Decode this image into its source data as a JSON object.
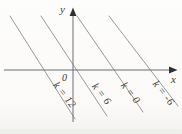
{
  "figure": {
    "width": 182,
    "height": 134,
    "colors": {
      "level_line": "#9a9a9a",
      "axis": "#6e6e6e",
      "arrow_fill": "#2f2f2f",
      "text": "#3a3a3a"
    },
    "axes": {
      "x": {
        "x1": 4,
        "y1": 70,
        "x2": 170,
        "y2": 70,
        "arrow_points": "177.5,70 169,66.6 169,73.4",
        "label": "x",
        "label_x": 171,
        "label_y": 83
      },
      "y": {
        "x1": 73,
        "y1": 122,
        "x2": 73,
        "y2": 15,
        "arrow_points": "73,7.5 69.6,16 76.4,16",
        "label": "y",
        "label_x": 60,
        "label_y": 13
      },
      "origin": {
        "label": "0",
        "x": 62,
        "y": 81
      }
    },
    "level_lines": [
      {
        "name": "line-k-12",
        "label": "k = 12",
        "x1": 10,
        "y1": 16,
        "x2": 75,
        "y2": 119,
        "label_x": 62,
        "label_y": 97,
        "label_angle": 52
      },
      {
        "name": "line-k-6",
        "label": "k = 6",
        "x1": 41,
        "y1": 16,
        "x2": 107,
        "y2": 116,
        "label_x": 99,
        "label_y": 96,
        "label_angle": 52
      },
      {
        "name": "line-k-0",
        "label": "k = 0",
        "x1": 77,
        "y1": 16,
        "x2": 143,
        "y2": 112,
        "label_x": 128,
        "label_y": 95,
        "label_angle": 52
      },
      {
        "name": "line-k-neg6",
        "label": "k = -6",
        "x1": 109,
        "y1": 16,
        "x2": 178,
        "y2": 106,
        "label_x": 161,
        "label_y": 95,
        "label_angle": 52
      }
    ]
  }
}
